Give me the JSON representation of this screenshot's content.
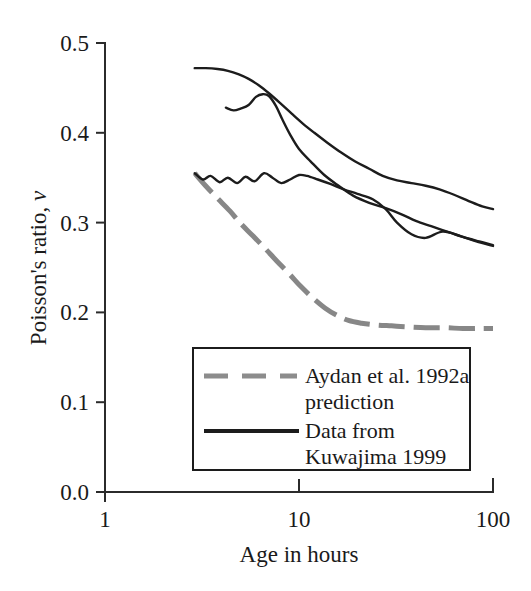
{
  "chart_data": {
    "type": "line",
    "title": "",
    "xlabel": "Age in hours",
    "ylabel": "Poisson's ratio, ν",
    "ylabel_main": "Poisson's ratio,",
    "ylabel_symbol": "ν",
    "xscale": "log",
    "xlim": [
      1,
      100
    ],
    "ylim": [
      0.0,
      0.5
    ],
    "grid": false,
    "x_ticks": [
      1,
      10,
      100
    ],
    "x_tick_labels": [
      "1",
      "10",
      "100"
    ],
    "y_ticks": [
      0.0,
      0.1,
      0.2,
      0.3,
      0.4,
      0.5
    ],
    "y_tick_labels": [
      "0.0",
      "0.1",
      "0.2",
      "0.3",
      "0.4",
      "0.5"
    ],
    "legend_position": "inside-lower-center",
    "colors": {
      "prediction": "#8c8c8c",
      "data": "#1c1c1c",
      "axis": "#2b2b2b"
    },
    "series": [
      {
        "name": "Aydan et al. 1992a prediction",
        "style": "dashed",
        "color": "#8c8c8c",
        "x": [
          2.9,
          3.3,
          3.8,
          4.4,
          5.0,
          5.8,
          6.7,
          7.7,
          8.9,
          10.2,
          11.8,
          13.6,
          15.6,
          18.0,
          21.0,
          25.0,
          30.0,
          36.0,
          45.0,
          56.0,
          70.0,
          85.0,
          100.0
        ],
        "y": [
          0.355,
          0.341,
          0.327,
          0.313,
          0.299,
          0.285,
          0.271,
          0.257,
          0.243,
          0.229,
          0.216,
          0.205,
          0.197,
          0.191,
          0.188,
          0.186,
          0.185,
          0.184,
          0.183,
          0.183,
          0.182,
          0.182,
          0.182
        ]
      },
      {
        "name": "Data from Kuwajima 1999 - upper curve",
        "style": "solid",
        "color": "#1c1c1c",
        "x": [
          2.9,
          3.3,
          3.8,
          4.3,
          4.9,
          5.5,
          6.2,
          7.0,
          8.0,
          9.2,
          10.5,
          12.0,
          14.0,
          16.5,
          19.5,
          23.0,
          27.0,
          32.0,
          38.0,
          45.0,
          53.0,
          63.0,
          75.0,
          88.0,
          100.0
        ],
        "y": [
          0.472,
          0.472,
          0.471,
          0.469,
          0.465,
          0.46,
          0.453,
          0.444,
          0.433,
          0.421,
          0.41,
          0.4,
          0.389,
          0.378,
          0.368,
          0.36,
          0.352,
          0.347,
          0.344,
          0.341,
          0.337,
          0.331,
          0.324,
          0.318,
          0.315
        ]
      },
      {
        "name": "Data from Kuwajima 1999 - middle curve",
        "style": "solid",
        "color": "#1c1c1c",
        "x": [
          4.2,
          4.6,
          5.0,
          5.5,
          6.0,
          6.5,
          7.0,
          7.6,
          8.2,
          9.0,
          10.0,
          11.5,
          13.5,
          16.0,
          19.0,
          23.0,
          28.0,
          34.0,
          40.0,
          48.0,
          58.0,
          70.0,
          85.0,
          100.0
        ],
        "y": [
          0.428,
          0.425,
          0.427,
          0.431,
          0.44,
          0.443,
          0.441,
          0.43,
          0.415,
          0.398,
          0.382,
          0.368,
          0.353,
          0.341,
          0.33,
          0.322,
          0.316,
          0.309,
          0.302,
          0.296,
          0.29,
          0.284,
          0.279,
          0.275
        ]
      },
      {
        "name": "Data from Kuwajima 1999 - lower wavy curve",
        "style": "solid",
        "color": "#1c1c1c",
        "x": [
          2.9,
          3.2,
          3.5,
          3.9,
          4.3,
          4.8,
          5.3,
          5.9,
          6.6,
          7.3,
          8.1,
          9.0,
          10.0,
          11.0,
          12.5,
          14.5,
          17.0,
          20.0,
          24.0,
          28.0,
          32.0,
          38.0,
          45.0,
          55.0,
          68.0,
          82.0,
          100.0
        ],
        "y": [
          0.355,
          0.348,
          0.352,
          0.345,
          0.35,
          0.344,
          0.351,
          0.346,
          0.355,
          0.35,
          0.344,
          0.348,
          0.353,
          0.352,
          0.348,
          0.343,
          0.337,
          0.332,
          0.326,
          0.315,
          0.3,
          0.287,
          0.283,
          0.29,
          0.285,
          0.279,
          0.274
        ]
      }
    ],
    "legend": {
      "entries": [
        {
          "style": "dashed",
          "color": "#8c8c8c",
          "line1": "Aydan et al. 1992a",
          "line2": "prediction"
        },
        {
          "style": "solid",
          "color": "#1c1c1c",
          "line1": "Data from",
          "line2": "Kuwajima 1999"
        }
      ]
    }
  }
}
